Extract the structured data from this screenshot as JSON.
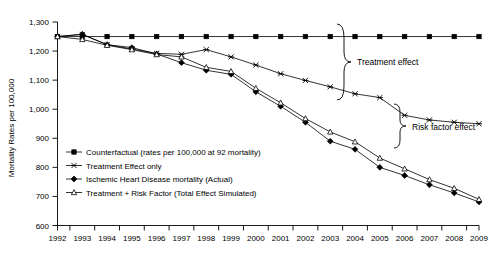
{
  "chart_data": {
    "type": "line",
    "title": "",
    "xlabel": "",
    "ylabel": "Mortality Rates per 100,000",
    "x": [
      1992,
      1993,
      1994,
      1995,
      1996,
      1997,
      1998,
      1999,
      2000,
      2001,
      2002,
      2003,
      2004,
      2005,
      2006,
      2007,
      2008,
      2009
    ],
    "xtick_labels": [
      "1992",
      "1993",
      "1994",
      "1995",
      "1996",
      "1997",
      "1998",
      "1999",
      "2000",
      "2001",
      "2002",
      "2003",
      "2004",
      "2005",
      "2006",
      "2007",
      "2008",
      "2009"
    ],
    "ytick_labels": [
      "600",
      "700",
      "800",
      "900",
      "1,000",
      "1,100",
      "1,200",
      "1,300"
    ],
    "yticks": [
      600,
      700,
      800,
      900,
      1000,
      1100,
      1200,
      1300
    ],
    "ylim": [
      600,
      1300
    ],
    "xlim": [
      1992,
      2009
    ],
    "grid": false,
    "legend_position": "inside-lower-left",
    "series": [
      {
        "name": "Counterfactual (rates per 100,000 at 92 mortality)",
        "marker": "filled-square",
        "values": [
          1250,
          1250,
          1250,
          1250,
          1250,
          1250,
          1250,
          1250,
          1250,
          1250,
          1250,
          1250,
          1250,
          1250,
          1250,
          1250,
          1250,
          1250
        ]
      },
      {
        "name": "Treatment Effect only",
        "marker": "x-cross",
        "values": [
          1250,
          1257,
          1222,
          1207,
          1192,
          1189,
          1205,
          1180,
          1152,
          1122,
          1099,
          1077,
          1053,
          1040,
          979,
          963,
          955,
          950
        ]
      },
      {
        "name": "Ischemic Heart Disease mortality (Actual)",
        "marker": "filled-diamond",
        "values": [
          1250,
          1258,
          1222,
          1212,
          1190,
          1160,
          1134,
          1120,
          1060,
          1010,
          955,
          890,
          862,
          800,
          772,
          740,
          712,
          681
        ]
      },
      {
        "name": "Treatment + Risk Factor (Total Effect Simulated)",
        "marker": "open-triangle",
        "values": [
          1250,
          1240,
          1220,
          1205,
          1188,
          1180,
          1144,
          1130,
          1072,
          1022,
          968,
          922,
          888,
          832,
          795,
          758,
          728,
          690
        ]
      }
    ],
    "annotations": [
      {
        "name": "treatment-effect",
        "text": "Treatment effect"
      },
      {
        "name": "risk-factor-effect",
        "text": "Risk factor effect"
      }
    ]
  }
}
